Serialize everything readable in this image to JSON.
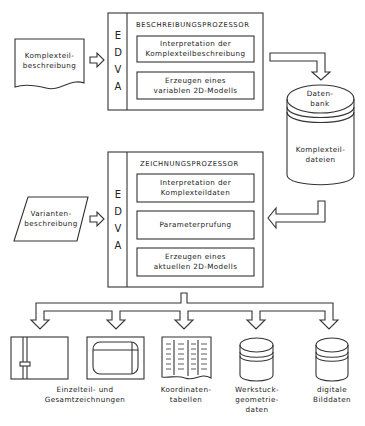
{
  "inputs": {
    "komplexteil": {
      "line1": "Komplexteil-",
      "line2": "beschreibung"
    },
    "varianten": {
      "line1": "Varianten-",
      "line2": "beschreibung"
    }
  },
  "beschreibungsprozessor": {
    "title": "BESCHREIBUNGSPROZESSOR",
    "edva": [
      "E",
      "D",
      "V",
      "A"
    ],
    "steps": [
      {
        "line1": "Interpretation der",
        "line2": "Komplexteilbeschreibung"
      },
      {
        "line1": "Erzeugen eines",
        "line2": "variablen 2D-Modells"
      }
    ]
  },
  "datenbank": {
    "top": {
      "line1": "Daten-",
      "line2": "bank"
    },
    "body": {
      "line1": "Komplexteil-",
      "line2": "dateien"
    }
  },
  "zeichnungsprozessor": {
    "title": "ZEICHNUNGSPROZESSOR",
    "edva": [
      "E",
      "D",
      "V",
      "A"
    ],
    "steps": [
      {
        "line1": "Interpretation der",
        "line2": "Komplexteildaten"
      },
      {
        "line1": "Parameterprufung",
        "line2": ""
      },
      {
        "line1": "Erzeugen eines",
        "line2": "aktuellen 2D-Modells"
      }
    ]
  },
  "outputs": [
    {
      "line1": "Einzelteil- und",
      "line2": "Gesamtzeichnungen",
      "line3": "",
      "icon": "drawing-sheet-icon"
    },
    {
      "line1": "Koordinaten-",
      "line2": "tabellen",
      "line3": "",
      "icon": "table-document-icon"
    },
    {
      "line1": "Werkstuck-",
      "line2": "geometrie-",
      "line3": "daten",
      "icon": "database-icon"
    },
    {
      "line1": "digitale",
      "line2": "Bilddaten",
      "line3": "",
      "icon": "database-icon"
    }
  ]
}
